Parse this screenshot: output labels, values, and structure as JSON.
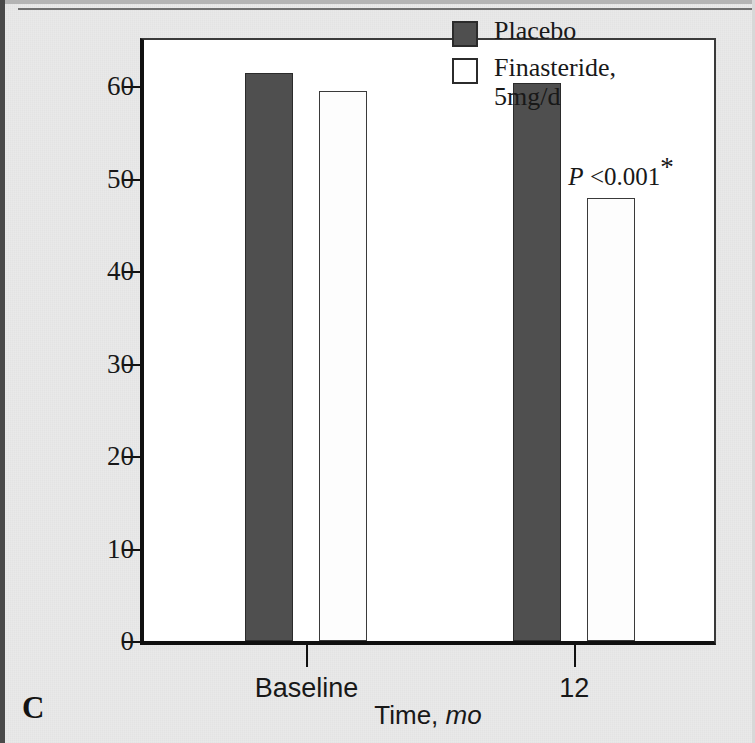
{
  "figure": {
    "panel_letter": "C",
    "background_color": "#e9e9e9",
    "frame_color": "#111111"
  },
  "chart_data": {
    "type": "bar",
    "title": "",
    "subtitle": "",
    "categories": [
      "Baseline",
      "12"
    ],
    "series": [
      {
        "name": "Placebo",
        "values": [
          61.4,
          60.3
        ],
        "color": "#4f4f4f",
        "swatch": "filled"
      },
      {
        "name": "Finasteride, 5mg/d",
        "values": [
          59.5,
          47.9
        ],
        "color": "#ffffff",
        "swatch": "hollow"
      }
    ],
    "xlabel": "Time, mo",
    "xlabel_main": "Time, ",
    "xlabel_unit": "mo",
    "ylabel": "Mean prostate volume, mL",
    "ylabel_main": "Mean prostate volume, ",
    "ylabel_unit": "mL",
    "ylim": [
      0,
      65
    ],
    "yticks": [
      0,
      10,
      20,
      30,
      40,
      50,
      60
    ],
    "ytick_labels": [
      "0",
      "10",
      "20",
      "30",
      "40",
      "50",
      "60"
    ],
    "grid": false,
    "legend_position": "top-right",
    "annotations": [
      {
        "text": "P <0.001*",
        "prefix": "P",
        "body": " <0.001",
        "marker": "*",
        "target_series": "Finasteride, 5mg/d",
        "target_category": "12"
      }
    ]
  },
  "legend": {
    "items": [
      {
        "label": "Placebo",
        "swatch": "filled"
      },
      {
        "label": "Finasteride,",
        "label_line2": "5mg/d",
        "swatch": "hollow"
      }
    ]
  }
}
